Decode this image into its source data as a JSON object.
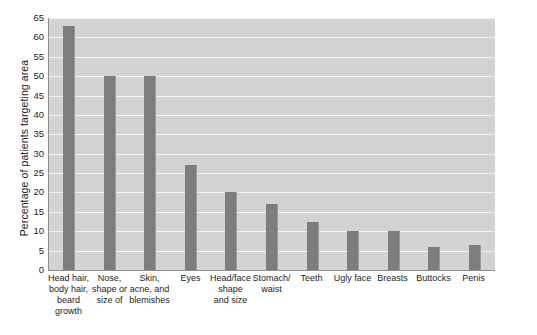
{
  "chart_data": {
    "type": "bar",
    "title": "",
    "xlabel": "",
    "ylabel": "Percentage of patients targeting area",
    "ylim": [
      0,
      65
    ],
    "ytick_step": 5,
    "yticks": [
      65,
      60,
      55,
      50,
      45,
      40,
      35,
      30,
      25,
      20,
      15,
      10,
      5,
      0
    ],
    "grid": true,
    "legend": "none",
    "categories": [
      "Head hair, body hair, beard growth",
      "Nose, shape or size of",
      "Skin, acne, and blemishes",
      "Eyes",
      "Head/face shape and size",
      "Stomach/ waist",
      "Teeth",
      "Ugly face",
      "Breasts",
      "Buttocks",
      "Penis"
    ],
    "category_lines": [
      [
        "Head hair,",
        "body hair,",
        "beard",
        "growth"
      ],
      [
        "Nose,",
        "shape or",
        "size of"
      ],
      [
        "Skin,",
        "acne, and",
        "blemishes"
      ],
      [
        "Eyes"
      ],
      [
        "Head/face",
        "shape",
        "and size"
      ],
      [
        "Stomach/",
        "waist"
      ],
      [
        "Teeth"
      ],
      [
        "Ugly face"
      ],
      [
        "Breasts"
      ],
      [
        "Buttocks"
      ],
      [
        "Penis"
      ]
    ],
    "values": [
      63,
      50,
      50,
      27,
      20,
      17,
      12.5,
      10,
      10,
      6,
      6.5
    ],
    "bar_color": "#7d7d7d",
    "plot_background": "#d3d3d3",
    "gridline_color": "#f4f4f4",
    "axis_color": "#8f8f8f"
  },
  "annotations": {
    "copyright": "Copyright © Cengage Learning 2013"
  }
}
